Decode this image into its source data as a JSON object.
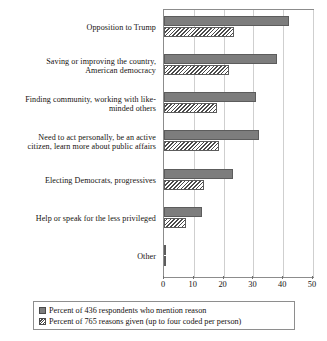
{
  "chart_data": {
    "type": "bar",
    "orientation": "horizontal",
    "title": "",
    "xlabel": "",
    "ylabel": "",
    "xlim": [
      0,
      50
    ],
    "xticks": [
      0,
      10,
      20,
      30,
      40,
      50
    ],
    "grid": true,
    "legend_position": "below",
    "categories": [
      "Opposition to Trump",
      "Saving or improving the country, American democracy",
      "Finding community, working with like-minded others",
      "Need to act personally, be an active citizen, learn more about public affairs",
      "Electing Democrats, progressives",
      "Help or speak for the less privileged",
      "Other"
    ],
    "category_lines": [
      [
        "Opposition to Trump"
      ],
      [
        "Saving or improving the country,",
        "American democracy"
      ],
      [
        "Finding community, working with like-",
        "minded others"
      ],
      [
        "Need to act personally, be an active",
        "citizen, learn more about public affairs"
      ],
      [
        "Electing Democrats, progressives"
      ],
      [
        "Help or speak for the less privileged"
      ],
      [
        "Other"
      ]
    ],
    "series": [
      {
        "name": "Percent of 436 respondents who mention reason",
        "style": "solid-gray",
        "color": "#7d7d7d",
        "values": [
          41.9,
          38.0,
          30.8,
          31.8,
          23.2,
          12.7,
          0.7
        ]
      },
      {
        "name": "Percent of 765 reasons given (up to four coded per person)",
        "style": "hatched",
        "color": "#ffffff",
        "values": [
          23.5,
          21.8,
          17.8,
          18.4,
          13.4,
          7.3,
          0.5
        ]
      }
    ]
  },
  "axis": {
    "tick_labels": [
      "0",
      "10",
      "20",
      "30",
      "40",
      "50"
    ]
  },
  "legend": {
    "items": [
      {
        "label": "Percent of 436 respondents who mention reason",
        "swatch": "solid-gray-swatch"
      },
      {
        "label": "Percent of 765 reasons given (up to four coded per person)",
        "swatch": "hatched-swatch"
      }
    ]
  }
}
